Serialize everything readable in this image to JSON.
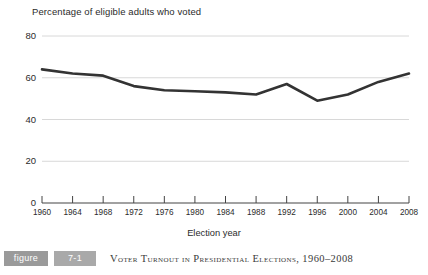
{
  "chart_data": {
    "type": "line",
    "title": "Percentage of eligible adults who voted",
    "xlabel": "Election year",
    "ylabel": "",
    "categories": [
      "1960",
      "1964",
      "1968",
      "1972",
      "1976",
      "1980",
      "1984",
      "1988",
      "1992",
      "1996",
      "2000",
      "2004",
      "2008"
    ],
    "values": [
      64,
      62,
      61,
      56,
      54,
      53.5,
      53,
      52,
      57,
      49,
      52,
      58,
      62
    ],
    "series": [
      {
        "name": "Percentage of eligible adults who voted",
        "values": [
          64,
          62,
          61,
          56,
          54,
          53.5,
          53,
          52,
          57,
          49,
          52,
          58,
          62
        ]
      }
    ],
    "ylim": [
      0,
      80
    ],
    "yticks": [
      0,
      20,
      40,
      60,
      80
    ],
    "ytick_labels": [
      "0",
      "20",
      "40",
      "60",
      "80"
    ],
    "xlim": [
      "1960",
      "2008"
    ],
    "grid": true,
    "grid_axis": "y",
    "legend": "none",
    "line_color": "#333333",
    "grid_color": "#d8d8d8",
    "axis_color": "#444444"
  },
  "caption": {
    "badge_label": "figure",
    "figure_number": "7-1",
    "text": "Voter Turnout in Presidential Elections, 1960–2008"
  }
}
